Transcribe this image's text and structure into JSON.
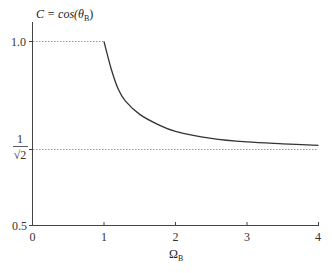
{
  "chart_data": {
    "type": "line",
    "title": "",
    "ylabel": "C = cos(θB)",
    "ylabel_main": "C = cos(θ",
    "ylabel_sub": "B",
    "ylabel_close": ")",
    "xlabel": "ΩB",
    "xlabel_main": "Ω",
    "xlabel_sub": "B",
    "xlim": [
      0,
      4
    ],
    "ylim": [
      0.5,
      1.05
    ],
    "x_ticks": [
      "0",
      "1",
      "2",
      "3",
      "4"
    ],
    "y_ticks": [
      {
        "value": 0.5,
        "label": "0.5"
      },
      {
        "value": 0.7071,
        "label": "1/√2"
      },
      {
        "value": 1.0,
        "label": "1.0"
      }
    ],
    "grid": false,
    "reference_lines": [
      {
        "y": 1.0,
        "x_range": [
          0,
          1
        ],
        "style": "dotted"
      },
      {
        "y": 0.7071,
        "x_range": [
          0,
          4
        ],
        "style": "dotted"
      }
    ],
    "series": [
      {
        "name": "C",
        "x": [
          1.0,
          1.1,
          1.2,
          1.3,
          1.5,
          1.75,
          2.0,
          2.5,
          3.0,
          3.5,
          4.0
        ],
        "values": [
          1.0,
          0.926,
          0.87,
          0.838,
          0.802,
          0.775,
          0.756,
          0.737,
          0.727,
          0.722,
          0.718
        ]
      }
    ]
  },
  "labels": {
    "y_top": "1.0",
    "y_mid_num": "1",
    "y_mid_den": "√2",
    "y_bottom": "0.5",
    "x0": "0",
    "x1": "1",
    "x2": "2",
    "x3": "3",
    "x4": "4",
    "y_title_main": "C = cos(θ",
    "y_title_sub": "B",
    "y_title_close": ")",
    "x_title_main": "Ω",
    "x_title_sub": "B"
  }
}
